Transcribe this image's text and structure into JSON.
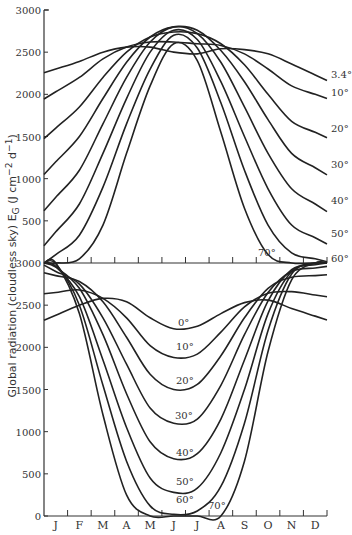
{
  "chart_data": [
    {
      "type": "line",
      "panel": "top",
      "title": "",
      "xlabel": "",
      "ylabel": "Global radiation (cloudless sky) E_G (J cm^-2 d^-1)",
      "ylim": [
        0,
        3000
      ],
      "yticks": [
        3000,
        2500,
        2000,
        1500,
        1000,
        500
      ],
      "x": [
        "J",
        "F",
        "M",
        "A",
        "M",
        "J",
        "J",
        "A",
        "S",
        "O",
        "N",
        "D"
      ],
      "grid": false,
      "series": [
        {
          "name": "3.4°",
          "values": [
            2300,
            2390,
            2500,
            2560,
            2560,
            2500,
            2480,
            2540,
            2530,
            2480,
            2360,
            2230
          ]
        },
        {
          "name": "10°",
          "values": [
            2030,
            2200,
            2420,
            2560,
            2620,
            2620,
            2600,
            2580,
            2480,
            2300,
            2100,
            2000
          ]
        },
        {
          "name": "20°",
          "values": [
            1600,
            1850,
            2200,
            2500,
            2680,
            2740,
            2720,
            2600,
            2350,
            2000,
            1680,
            1550
          ]
        },
        {
          "name": "30°",
          "values": [
            1200,
            1500,
            1950,
            2380,
            2680,
            2800,
            2760,
            2520,
            2150,
            1700,
            1300,
            1130
          ]
        },
        {
          "name": "40°",
          "values": [
            780,
            1100,
            1650,
            2200,
            2620,
            2800,
            2720,
            2380,
            1850,
            1300,
            880,
            700
          ]
        },
        {
          "name": "50°",
          "values": [
            370,
            700,
            1300,
            1950,
            2500,
            2760,
            2650,
            2150,
            1500,
            880,
            450,
            300
          ]
        },
        {
          "name": "60°",
          "values": [
            100,
            330,
            900,
            1650,
            2300,
            2700,
            2550,
            1900,
            1100,
            450,
            120,
            50
          ]
        },
        {
          "name": "70°",
          "values": [
            0,
            50,
            450,
            1300,
            2100,
            2600,
            2400,
            1550,
            650,
            100,
            0,
            0
          ]
        }
      ]
    },
    {
      "type": "line",
      "panel": "bottom",
      "ylim": [
        0,
        3000
      ],
      "yticks": [
        3000,
        2500,
        2000,
        1500,
        1000,
        500,
        0
      ],
      "x": [
        "J",
        "F",
        "M",
        "A",
        "M",
        "J",
        "J",
        "A",
        "S",
        "O",
        "N",
        "D"
      ],
      "grid": false,
      "series": [
        {
          "name": "0°",
          "values": [
            2380,
            2500,
            2580,
            2540,
            2350,
            2220,
            2250,
            2400,
            2530,
            2560,
            2460,
            2370
          ]
        },
        {
          "name": "10°",
          "values": [
            2650,
            2680,
            2580,
            2350,
            2020,
            1880,
            1920,
            2180,
            2480,
            2640,
            2660,
            2620
          ]
        },
        {
          "name": "20°",
          "values": [
            2850,
            2780,
            2540,
            2120,
            1680,
            1500,
            1560,
            1900,
            2350,
            2700,
            2830,
            2850
          ]
        },
        {
          "name": "30°",
          "values": [
            2900,
            2750,
            2350,
            1800,
            1280,
            1100,
            1150,
            1550,
            2150,
            2650,
            2900,
            2940
          ]
        },
        {
          "name": "40°",
          "values": [
            2950,
            2700,
            2150,
            1450,
            880,
            680,
            740,
            1150,
            1850,
            2550,
            2920,
            2980
          ]
        },
        {
          "name": "50°",
          "values": [
            2960,
            2600,
            1850,
            1050,
            450,
            280,
            330,
            750,
            1500,
            2400,
            2900,
            3000
          ]
        },
        {
          "name": "60°",
          "values": [
            2990,
            2500,
            1550,
            650,
            120,
            20,
            60,
            350,
            1100,
            2200,
            2870,
            3000
          ]
        },
        {
          "name": "70°",
          "values": [
            3000,
            2400,
            1200,
            250,
            0,
            0,
            0,
            0,
            650,
            1950,
            2800,
            3000
          ]
        }
      ]
    }
  ],
  "axis": {
    "ylabel_text": "Global radiation (cloudless sky) E",
    "ylabel_sub": "G",
    "ylabel_units": " (J  cm",
    "ylabel_units_sup1": "−2",
    "ylabel_units_mid": " d",
    "ylabel_units_sup2": "−1",
    "ylabel_units_end": ")",
    "months": [
      "J",
      "F",
      "M",
      "A",
      "M",
      "J",
      "J",
      "A",
      "S",
      "O",
      "N",
      "D"
    ]
  },
  "labels": {
    "top": [
      "3.4°",
      "10°",
      "20°",
      "30°",
      "40°",
      "50°",
      "60°",
      "70°"
    ],
    "bottom": [
      "0°",
      "10°",
      "20°",
      "30°",
      "40°",
      "50°",
      "60°",
      "70°"
    ]
  }
}
